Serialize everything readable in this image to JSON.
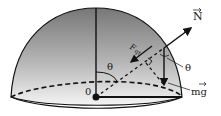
{
  "diagram": {
    "labels": {
      "normal_force": "N",
      "weight": "mg",
      "centripetal": "F",
      "centripetal_sub": "qt",
      "angle_top": "θ",
      "angle_side": "θ",
      "origin": "0"
    },
    "colors": {
      "stroke": "#111111",
      "dome_top": "#7a7a7a",
      "dome_bottom": "#f2f2f2",
      "base_fill": "#ffffff"
    }
  }
}
